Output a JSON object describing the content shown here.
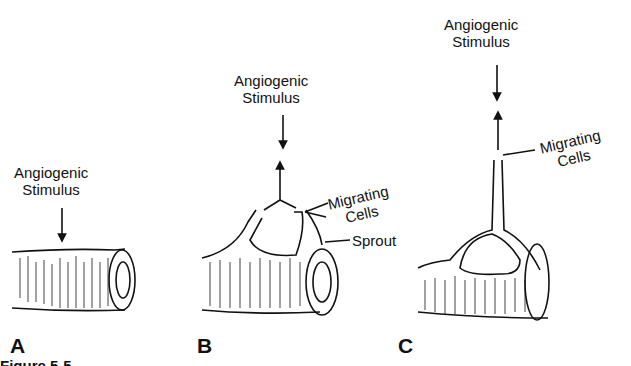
{
  "figure": {
    "panels": [
      {
        "id": "A",
        "label": "A",
        "stimulus_label": [
          "Angiogenic",
          "Stimulus"
        ]
      },
      {
        "id": "B",
        "label": "B",
        "stimulus_label": [
          "Angiogenic",
          "Stimulus"
        ],
        "callouts": {
          "migrating": [
            "Migrating",
            "Cells"
          ],
          "sprout": "Sprout"
        }
      },
      {
        "id": "C",
        "label": "C",
        "stimulus_label": [
          "Angiogenic",
          "Stimulus"
        ],
        "callouts": {
          "migrating": [
            "Migrating",
            "Cells"
          ]
        }
      }
    ],
    "caption": "Figure 5-5"
  }
}
